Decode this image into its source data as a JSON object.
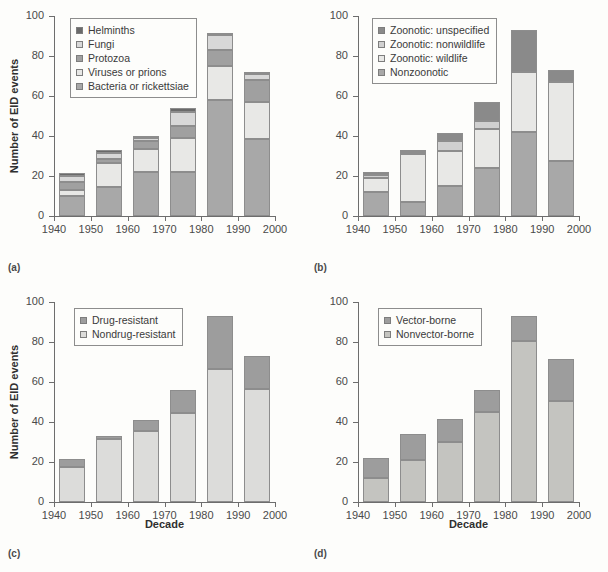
{
  "figure": {
    "background": "#fdfdfb",
    "panels": [
      "a",
      "b",
      "c",
      "d"
    ]
  },
  "axes": {
    "y_label": "Number of EID events",
    "x_label": "Decade",
    "y_ticks": [
      0,
      20,
      40,
      60,
      80,
      100
    ],
    "x_ticks": [
      1940,
      1950,
      1960,
      1970,
      1980,
      1990,
      2000
    ],
    "ylim": [
      0,
      100
    ],
    "xlim": [
      1940,
      2000
    ]
  },
  "colors": {
    "dark_gray": "#7d7d7d",
    "mid_gray": "#a8a8a8",
    "light_gray": "#d8d8d8",
    "pale_gray": "#e8e8e6",
    "very_dark": "#6a6a6a",
    "outline": "#8d8d8d"
  },
  "panel_labels": {
    "a": "(a)",
    "b": "(b)",
    "c": "(c)",
    "d": "(d)"
  },
  "chart_data": [
    {
      "panel": "a",
      "type": "bar",
      "stacked": true,
      "title": "",
      "xlabel": "",
      "ylabel": "Number of EID events",
      "xlim": [
        1940,
        2000
      ],
      "ylim": [
        0,
        100
      ],
      "grid": false,
      "legend_position": "top-left",
      "categories": [
        "1940s",
        "1950s",
        "1960s",
        "1970s",
        "1980s",
        "1990s"
      ],
      "bar_centers": [
        1945,
        1955,
        1965,
        1975,
        1985,
        1995
      ],
      "totals": [
        21.5,
        33,
        40,
        54,
        91.5,
        72
      ],
      "series": [
        {
          "name": "Bacteria or rickettsiae",
          "color": "#a8a8a8",
          "values": [
            10,
            14.5,
            22,
            22,
            58,
            38.5
          ]
        },
        {
          "name": "Viruses or prions",
          "color": "#e8e8e6",
          "values": [
            3,
            12,
            11.5,
            17,
            17,
            18.5
          ]
        },
        {
          "name": "Protozoa",
          "color": "#a0a0a0",
          "values": [
            4,
            2,
            4,
            6,
            8,
            11
          ]
        },
        {
          "name": "Fungi",
          "color": "#d8d8d8",
          "values": [
            3,
            3,
            1.5,
            7,
            7.5,
            3
          ]
        },
        {
          "name": "Helminths",
          "color": "#6a6a6a",
          "values": [
            1.5,
            1.5,
            1,
            2,
            1,
            1
          ]
        }
      ]
    },
    {
      "panel": "b",
      "type": "bar",
      "stacked": true,
      "title": "",
      "xlabel": "",
      "ylabel": "",
      "xlim": [
        1940,
        2000
      ],
      "ylim": [
        0,
        100
      ],
      "grid": false,
      "legend_position": "top-left",
      "categories": [
        "1940s",
        "1950s",
        "1960s",
        "1970s",
        "1980s",
        "1990s"
      ],
      "bar_centers": [
        1945,
        1955,
        1965,
        1975,
        1985,
        1995
      ],
      "totals": [
        22,
        33,
        41.5,
        57,
        93,
        73
      ],
      "series": [
        {
          "name": "Nonzoonotic",
          "color": "#a8a8a8",
          "values": [
            12,
            7,
            15,
            24,
            42,
            27.5
          ]
        },
        {
          "name": "Zoonotic: wildlife",
          "color": "#e8e8e6",
          "values": [
            7,
            24,
            17.5,
            19.5,
            30,
            39.5
          ]
        },
        {
          "name": "Zoonotic: nonwildlife",
          "color": "#d0d0d0",
          "values": [
            1.5,
            1,
            5,
            4,
            0,
            0
          ]
        },
        {
          "name": "Zoonotic: unspecified",
          "color": "#8a8a8a",
          "values": [
            1.5,
            1,
            4,
            9.5,
            21,
            6
          ]
        }
      ]
    },
    {
      "panel": "c",
      "type": "bar",
      "stacked": true,
      "title": "",
      "xlabel": "Decade",
      "ylabel": "Number of EID events",
      "xlim": [
        1940,
        2000
      ],
      "ylim": [
        0,
        100
      ],
      "grid": false,
      "legend_position": "top-left",
      "categories": [
        "1940s",
        "1950s",
        "1960s",
        "1970s",
        "1980s",
        "1990s"
      ],
      "bar_centers": [
        1945,
        1955,
        1965,
        1975,
        1985,
        1995
      ],
      "totals": [
        21.5,
        33,
        41,
        56,
        93,
        73
      ],
      "series": [
        {
          "name": "Nondrug-resistant",
          "color": "#dcdcda",
          "values": [
            17.5,
            31.5,
            35.5,
            44.5,
            66.5,
            56.5
          ]
        },
        {
          "name": "Drug-resistant",
          "color": "#9d9d9d",
          "values": [
            4,
            1.5,
            5.5,
            11.5,
            26.5,
            16.5
          ]
        }
      ]
    },
    {
      "panel": "d",
      "type": "bar",
      "stacked": true,
      "title": "",
      "xlabel": "Decade",
      "ylabel": "",
      "xlim": [
        1940,
        2000
      ],
      "ylim": [
        0,
        100
      ],
      "grid": false,
      "legend_position": "top-left",
      "categories": [
        "1940s",
        "1950s",
        "1960s",
        "1970s",
        "1980s",
        "1990s"
      ],
      "bar_centers": [
        1945,
        1955,
        1965,
        1975,
        1985,
        1995
      ],
      "totals": [
        22,
        34,
        41.5,
        56,
        93,
        71.5
      ],
      "series": [
        {
          "name": "Nonvector-borne",
          "color": "#c4c4c0",
          "values": [
            12,
            21,
            30,
            45,
            80.5,
            50.5
          ]
        },
        {
          "name": "Vector-borne",
          "color": "#9d9d9d",
          "values": [
            10,
            13,
            11.5,
            11,
            12.5,
            21
          ]
        }
      ]
    }
  ]
}
